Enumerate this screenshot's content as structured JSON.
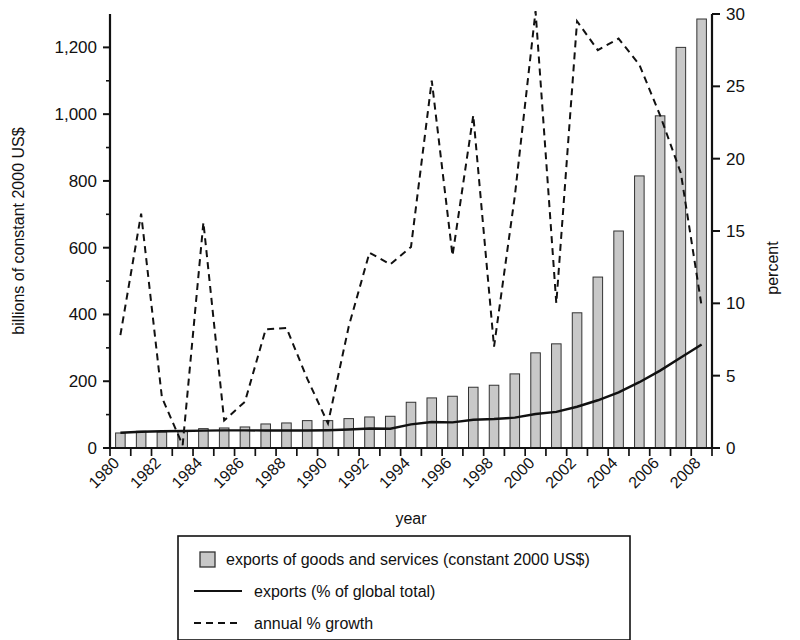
{
  "chart_data": {
    "type": "bar",
    "title": "",
    "xlabel": "year",
    "ylabel": "billions of constant 2000 US$",
    "ylabel_right": "percent",
    "ylim": [
      0,
      1300
    ],
    "ylim_right": [
      0,
      30
    ],
    "grid": false,
    "legend_position": "bottom",
    "x": [
      1980,
      1981,
      1982,
      1983,
      1984,
      1985,
      1986,
      1987,
      1988,
      1989,
      1990,
      1991,
      1992,
      1993,
      1994,
      1995,
      1996,
      1997,
      1998,
      1999,
      2000,
      2001,
      2002,
      2003,
      2004,
      2005,
      2006,
      2007,
      2008
    ],
    "categories": [
      "1980",
      "1981",
      "1982",
      "1983",
      "1984",
      "1985",
      "1986",
      "1987",
      "1988",
      "1989",
      "1990",
      "1991",
      "1992",
      "1993",
      "1994",
      "1995",
      "1996",
      "1997",
      "1998",
      "1999",
      "2000",
      "2001",
      "2002",
      "2003",
      "2004",
      "2005",
      "2006",
      "2007",
      "2008"
    ],
    "x_tick_labels": [
      "1980",
      "1982",
      "1984",
      "1986",
      "1988",
      "1990",
      "1992",
      "1994",
      "1996",
      "1998",
      "2000",
      "2002",
      "2004",
      "2006",
      "2008"
    ],
    "y_tick_labels_left": [
      "0",
      "200",
      "400",
      "600",
      "800",
      "1,000",
      "1,200"
    ],
    "y_ticks_left": [
      0,
      200,
      400,
      600,
      800,
      1000,
      1200
    ],
    "y_tick_labels_right": [
      "0",
      "5",
      "10",
      "15",
      "20",
      "25",
      "30"
    ],
    "y_ticks_right": [
      0,
      5,
      10,
      15,
      20,
      25,
      30
    ],
    "series": [
      {
        "name": "exports of goods and services (constant 2000 US$)",
        "kind": "bar",
        "axis": "left",
        "unit": "billions of constant 2000 US$",
        "color": "#c8c8c8",
        "values": [
          45,
          50,
          48,
          52,
          58,
          60,
          63,
          72,
          75,
          82,
          82,
          88,
          93,
          95,
          137,
          150,
          155,
          182,
          188,
          222,
          285,
          312,
          405,
          512,
          650,
          815,
          995,
          1200,
          1285
        ]
      },
      {
        "name": "exports (% of global total)",
        "kind": "line",
        "axis": "right",
        "unit": "percent",
        "color": "#111111",
        "style": "solid",
        "values": [
          1.05,
          1.12,
          1.16,
          1.18,
          1.2,
          1.22,
          1.22,
          1.21,
          1.21,
          1.21,
          1.23,
          1.28,
          1.35,
          1.33,
          1.63,
          1.8,
          1.77,
          1.95,
          2.0,
          2.1,
          2.35,
          2.5,
          2.85,
          3.3,
          3.85,
          4.55,
          5.35,
          6.25,
          7.15
        ]
      },
      {
        "name": "annual % growth",
        "kind": "line",
        "axis": "right",
        "unit": "percent",
        "style": "dashed",
        "color": "#111111",
        "values": [
          7.8,
          16.2,
          3.5,
          0.2,
          15.6,
          1.9,
          3.2,
          8.2,
          8.3,
          4.8,
          1.7,
          8.4,
          13.5,
          12.7,
          13.9,
          25.4,
          13.3,
          23.0,
          7.0,
          17.4,
          30.2,
          10.0,
          29.5,
          27.5,
          28.3,
          26.5,
          23.0,
          19.0,
          9.8
        ]
      }
    ],
    "legend": [
      {
        "label": "exports of goods and services (constant 2000 US$)",
        "marker": "square-swatch"
      },
      {
        "label": "exports (% of global total)",
        "marker": "solid-line"
      },
      {
        "label": "annual % growth",
        "marker": "dashed-line"
      }
    ]
  },
  "axes": {
    "left_title": "billions of constant 2000 US$",
    "right_title": "percent",
    "x_title": "year"
  },
  "colors": {
    "bar_fill": "#c8c8c8",
    "bar_stroke": "#333333",
    "line": "#111111",
    "axis": "#111111",
    "background": "#ffffff"
  }
}
